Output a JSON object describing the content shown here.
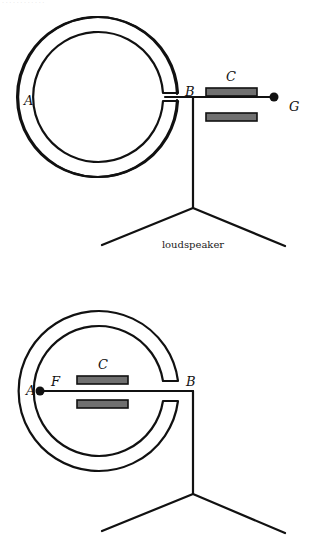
{
  "header_fragment": "· · · · · · · · · · · ·",
  "figure_top": {
    "labels": {
      "A": "A",
      "B": "B",
      "C": "C",
      "G": "G"
    },
    "caption": "loudspeaker"
  },
  "figure_bottom": {
    "labels": {
      "A": "A",
      "B": "B",
      "C": "C",
      "F": "F"
    }
  },
  "colors": {
    "line": "#111111",
    "plate": "#707070"
  }
}
